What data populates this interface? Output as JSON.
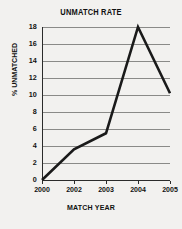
{
  "chart_data": {
    "type": "line",
    "title": "UNMATCH RATE",
    "xlabel": "MATCH YEAR",
    "ylabel": "% UNMATCHED",
    "categories": [
      "2000",
      "2002",
      "2003",
      "2004",
      "2005"
    ],
    "values": [
      0,
      3.6,
      5.5,
      18,
      10.2
    ],
    "series": [
      {
        "name": "Unmatch rate",
        "values": [
          0,
          3.6,
          5.5,
          18,
          10.2
        ]
      }
    ],
    "ylim": [
      0,
      18
    ],
    "ytick_labels": [
      "0",
      "2",
      "4",
      "6",
      "8",
      "10",
      "12",
      "14",
      "16",
      "18"
    ],
    "ytick_values": [
      0,
      2,
      4,
      6,
      8,
      10,
      12,
      14,
      16,
      18
    ],
    "grid": "horizontal",
    "legend": "none",
    "line_color": "#1a1a1a",
    "grid_color": "#8a8a88",
    "background_color": "#f2f1ef",
    "text_color": "#111111"
  }
}
